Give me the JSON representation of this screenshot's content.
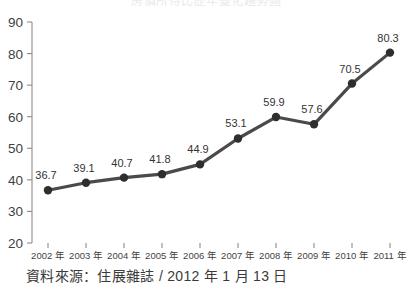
{
  "chart_data": {
    "type": "line",
    "title": "房價所得比歷年變化趨勢圖",
    "categories": [
      "2002 年",
      "2003 年",
      "2004 年",
      "2005 年",
      "2006 年",
      "2007 年",
      "2008 年",
      "2009 年",
      "2010 年",
      "2011 年"
    ],
    "values": [
      36.7,
      39.1,
      40.7,
      41.8,
      44.9,
      53.1,
      59.9,
      57.6,
      70.5,
      80.3
    ],
    "point_labels": [
      "36.7",
      "39.1",
      "40.7",
      "41.8",
      "44.9",
      "53.1",
      "59.9",
      "57.6",
      "70.5",
      "80.3"
    ],
    "xlabel": "",
    "ylabel": "",
    "ylim": [
      20,
      90
    ],
    "yticks": [
      20,
      30,
      40,
      50,
      60,
      70,
      80,
      90
    ],
    "ytick_labels": [
      "20",
      "30",
      "40",
      "50",
      "60",
      "70",
      "80",
      "90"
    ],
    "grid": false,
    "legend": false,
    "series_color": "#4a4a4a",
    "marker_color": "#2e2e2e",
    "axis_color": "#8c8c8c"
  },
  "footer": {
    "source_note": "資料來源：住展雜誌 / 2012 年 1 月 13 日"
  }
}
